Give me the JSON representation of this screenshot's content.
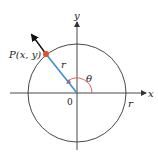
{
  "diagram": {
    "type": "polar-coordinates-circle",
    "labels": {
      "point": "P(x, y)",
      "radius_segment": "r",
      "radius_x_axis": "r",
      "angle": "θ",
      "origin": "0",
      "x_axis": "x",
      "y_axis": "y"
    },
    "colors": {
      "radius_line": "#3a8fd0",
      "point": "#e0502a",
      "angle_arc": "#d9534f",
      "circle": "#333333",
      "axes": "#333333",
      "arrow": "#111111"
    }
  }
}
